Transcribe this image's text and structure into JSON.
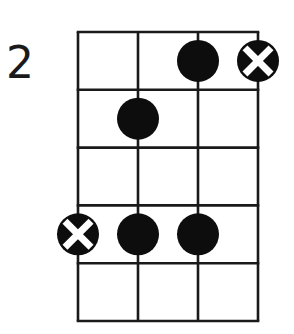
{
  "diagram": {
    "type": "chord-fretboard",
    "starting_fret_label": "2",
    "strings": 4,
    "frets": 5,
    "colors": {
      "line": "#1a1a1a",
      "dot": "#0d0d0d",
      "x_mark": "#ffffff",
      "background": "#ffffff"
    },
    "geometry": {
      "left": 78,
      "top": 32,
      "string_spacing": 60,
      "fret_spacing": 57.8,
      "dot_radius": 21
    },
    "markers": [
      {
        "string": 3,
        "fret": 1,
        "kind": "dot"
      },
      {
        "string": 4,
        "fret": 1,
        "kind": "x-dot"
      },
      {
        "string": 2,
        "fret": 2,
        "kind": "dot"
      },
      {
        "string": 1,
        "fret": 4,
        "kind": "x-dot"
      },
      {
        "string": 2,
        "fret": 4,
        "kind": "dot"
      },
      {
        "string": 3,
        "fret": 4,
        "kind": "dot"
      }
    ]
  }
}
